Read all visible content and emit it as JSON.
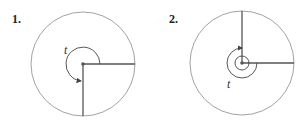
{
  "figures": [
    {
      "number": "1.",
      "angle_label": "t",
      "description": "Angle t in standard position, terminal side pointing down (3π/2)"
    },
    {
      "number": "2.",
      "angle_label": "t",
      "description": "Angle t with more than one full rotation ending pointing up"
    }
  ],
  "colors": {
    "circle": "#8a8a8a",
    "ray": "#555555",
    "arc": "#444444"
  }
}
